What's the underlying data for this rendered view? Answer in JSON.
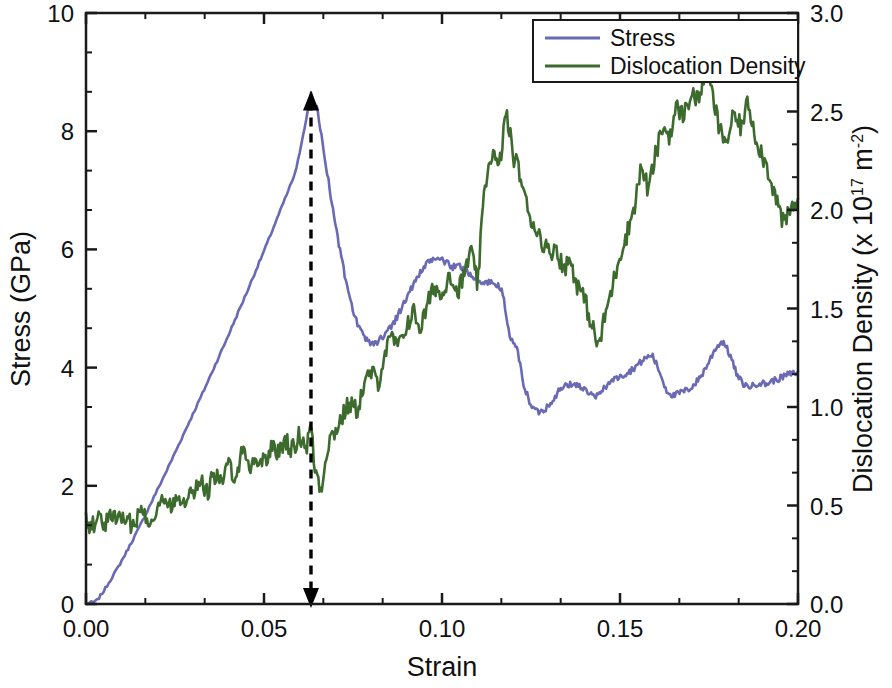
{
  "figure": {
    "title": "",
    "background": "#ffffff"
  },
  "axes": {
    "x": {
      "label": "Strain",
      "min": 0.0,
      "max": 0.2,
      "ticks": [
        0.0,
        0.05,
        0.1,
        0.15,
        0.2
      ],
      "tick_labels": [
        "0.00",
        "0.05",
        "0.10",
        "0.15",
        "0.20"
      ],
      "minor_per_major": 2
    },
    "y_left": {
      "label": "Stress (GPa)",
      "min": 0,
      "max": 10,
      "ticks": [
        0,
        2,
        4,
        6,
        8,
        10
      ],
      "tick_labels": [
        "0",
        "2",
        "4",
        "6",
        "8",
        "10"
      ],
      "minor_per_major": 2
    },
    "y_right": {
      "label_parts": {
        "pre": "Dislocation Density (x 10",
        "sup1": "17",
        "mid": " m",
        "sup2": "-2",
        "post": ")"
      },
      "label_plain": "Dislocation Density (x 10^17 m^-2)",
      "min": 0.0,
      "max": 3.0,
      "ticks": [
        0.0,
        0.5,
        1.0,
        1.5,
        2.0,
        2.5,
        3.0
      ],
      "tick_labels": [
        "0.0",
        "0.5",
        "1.0",
        "1.5",
        "2.0",
        "2.5",
        "3.0"
      ],
      "minor_per_major": 2
    }
  },
  "legend": {
    "position": "top-right",
    "entries": [
      {
        "label": "Stress",
        "color": "#6a6ab4",
        "axis": "left"
      },
      {
        "label": "Dislocation Density",
        "color": "#3d6b2e",
        "axis": "right"
      }
    ]
  },
  "annotation": {
    "type": "vertical-double-arrow",
    "name": "yield-point-marker",
    "x": 0.0632,
    "y_top_stress": 8.62,
    "y_bottom_stress": 0.0,
    "color": "#000000",
    "dash": "9,7"
  },
  "chart_data": {
    "type": "line",
    "title": "",
    "xlabel": "Strain",
    "ylabel": "Stress (GPa)",
    "y2label": "Dislocation Density (x 10^17 m^-2)",
    "xlim": [
      0.0,
      0.2
    ],
    "ylim": [
      0,
      10
    ],
    "y2lim": [
      0.0,
      3.0
    ],
    "grid": false,
    "legend_position": "top-right",
    "peak_stress_GPa": 8.62,
    "peak_strain": 0.0632,
    "series": [
      {
        "name": "Stress",
        "color": "#6a6ab4",
        "axis": "left",
        "units": "GPa",
        "x": [
          0.0,
          0.003,
          0.005,
          0.007,
          0.009,
          0.011,
          0.013,
          0.015,
          0.017,
          0.019,
          0.021,
          0.023,
          0.025,
          0.027,
          0.029,
          0.031,
          0.033,
          0.035,
          0.037,
          0.039,
          0.041,
          0.043,
          0.045,
          0.047,
          0.049,
          0.051,
          0.053,
          0.055,
          0.057,
          0.059,
          0.061,
          0.0632,
          0.065,
          0.067,
          0.069,
          0.071,
          0.073,
          0.075,
          0.077,
          0.079,
          0.081,
          0.083,
          0.085,
          0.087,
          0.089,
          0.091,
          0.093,
          0.095,
          0.097,
          0.099,
          0.101,
          0.103,
          0.105,
          0.107,
          0.109,
          0.111,
          0.113,
          0.115,
          0.117,
          0.119,
          0.121,
          0.123,
          0.125,
          0.127,
          0.129,
          0.131,
          0.133,
          0.135,
          0.137,
          0.139,
          0.141,
          0.143,
          0.145,
          0.147,
          0.149,
          0.151,
          0.153,
          0.155,
          0.157,
          0.159,
          0.161,
          0.163,
          0.165,
          0.167,
          0.169,
          0.171,
          0.173,
          0.175,
          0.177,
          0.179,
          0.181,
          0.183,
          0.185,
          0.187,
          0.189,
          0.191,
          0.193,
          0.195,
          0.197,
          0.2
        ],
        "y": [
          0.0,
          0.05,
          0.22,
          0.42,
          0.62,
          0.84,
          1.07,
          1.3,
          1.55,
          1.8,
          2.05,
          2.3,
          2.56,
          2.82,
          3.08,
          3.34,
          3.6,
          3.87,
          4.14,
          4.41,
          4.69,
          4.97,
          5.25,
          5.54,
          5.83,
          6.12,
          6.42,
          6.72,
          7.02,
          7.33,
          7.95,
          8.62,
          8.35,
          7.6,
          6.8,
          6.1,
          5.45,
          4.95,
          4.62,
          4.45,
          4.4,
          4.5,
          4.65,
          4.82,
          5.05,
          5.3,
          5.52,
          5.7,
          5.82,
          5.86,
          5.78,
          5.7,
          5.72,
          5.65,
          5.5,
          5.42,
          5.45,
          5.42,
          5.3,
          4.5,
          4.35,
          3.7,
          3.35,
          3.25,
          3.3,
          3.45,
          3.62,
          3.7,
          3.72,
          3.68,
          3.58,
          3.48,
          3.62,
          3.75,
          3.82,
          3.88,
          3.95,
          4.05,
          4.15,
          4.22,
          3.95,
          3.62,
          3.52,
          3.58,
          3.62,
          3.72,
          3.88,
          4.1,
          4.35,
          4.45,
          4.2,
          3.85,
          3.7,
          3.68,
          3.75,
          3.72,
          3.78,
          3.82,
          3.88,
          3.92
        ]
      },
      {
        "name": "Dislocation Density",
        "color": "#3d6b2e",
        "axis": "right",
        "units": "x 10^17 m^-2",
        "x": [
          0.0,
          0.002,
          0.004,
          0.006,
          0.008,
          0.01,
          0.012,
          0.014,
          0.016,
          0.018,
          0.02,
          0.022,
          0.024,
          0.026,
          0.028,
          0.03,
          0.032,
          0.034,
          0.036,
          0.038,
          0.04,
          0.042,
          0.044,
          0.046,
          0.048,
          0.05,
          0.052,
          0.054,
          0.056,
          0.058,
          0.06,
          0.062,
          0.0632,
          0.064,
          0.066,
          0.068,
          0.07,
          0.072,
          0.074,
          0.076,
          0.078,
          0.08,
          0.082,
          0.084,
          0.086,
          0.088,
          0.09,
          0.092,
          0.094,
          0.096,
          0.098,
          0.1,
          0.102,
          0.104,
          0.106,
          0.108,
          0.11,
          0.112,
          0.114,
          0.116,
          0.118,
          0.12,
          0.122,
          0.124,
          0.126,
          0.128,
          0.13,
          0.132,
          0.134,
          0.136,
          0.138,
          0.14,
          0.142,
          0.144,
          0.146,
          0.148,
          0.15,
          0.152,
          0.154,
          0.156,
          0.158,
          0.16,
          0.162,
          0.164,
          0.166,
          0.168,
          0.17,
          0.172,
          0.174,
          0.176,
          0.178,
          0.18,
          0.182,
          0.184,
          0.186,
          0.188,
          0.19,
          0.192,
          0.194,
          0.196,
          0.198,
          0.2
        ],
        "y": [
          0.42,
          0.4,
          0.44,
          0.41,
          0.46,
          0.43,
          0.4,
          0.44,
          0.47,
          0.43,
          0.49,
          0.52,
          0.5,
          0.56,
          0.53,
          0.58,
          0.62,
          0.57,
          0.66,
          0.61,
          0.7,
          0.66,
          0.78,
          0.7,
          0.74,
          0.72,
          0.8,
          0.76,
          0.84,
          0.78,
          0.86,
          0.8,
          0.92,
          0.72,
          0.58,
          0.82,
          0.88,
          0.95,
          1.02,
          0.98,
          1.1,
          1.18,
          1.12,
          1.28,
          1.35,
          1.3,
          1.42,
          1.48,
          1.4,
          1.52,
          1.62,
          1.55,
          1.7,
          1.58,
          1.65,
          1.8,
          1.62,
          2.12,
          2.3,
          2.2,
          2.5,
          2.28,
          2.18,
          2.0,
          1.92,
          1.85,
          1.78,
          1.82,
          1.7,
          1.75,
          1.62,
          1.55,
          1.42,
          1.3,
          1.48,
          1.62,
          1.78,
          1.88,
          2.02,
          2.22,
          2.1,
          2.28,
          2.42,
          2.38,
          2.52,
          2.48,
          2.6,
          2.55,
          2.72,
          2.58,
          2.4,
          2.35,
          2.48,
          2.42,
          2.55,
          2.38,
          2.28,
          2.18,
          2.05,
          1.92,
          2.0,
          2.05
        ]
      }
    ]
  }
}
